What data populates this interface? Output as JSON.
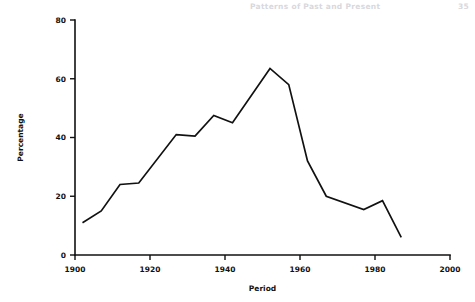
{
  "page_header": {
    "title": "Patterns of Past and Present",
    "page_number": "35"
  },
  "chart_data": {
    "type": "line",
    "title": "",
    "subtitle": "",
    "xlabel": "Period",
    "ylabel": "Percentage",
    "xlim": [
      1900,
      2000
    ],
    "ylim": [
      0,
      80
    ],
    "xticks": [
      1900,
      1920,
      1940,
      1960,
      1980,
      2000
    ],
    "xtick_labels": [
      "1900",
      "1920",
      "1940",
      "1960",
      "1980",
      "2000"
    ],
    "yticks": [
      0,
      20,
      40,
      60,
      80
    ],
    "ytick_labels": [
      "0",
      "20",
      "40",
      "60",
      "80"
    ],
    "grid": false,
    "legend": null,
    "legend_position": "none",
    "line_color": "#111111",
    "series": [
      {
        "name": "Percentage",
        "x": [
          1902,
          1907,
          1912,
          1917,
          1927,
          1932,
          1937,
          1942,
          1952,
          1957,
          1962,
          1967,
          1977,
          1982,
          1987
        ],
        "values": [
          11,
          15,
          24,
          24.5,
          41,
          40.5,
          47.5,
          45,
          63.5,
          58,
          32,
          20,
          15.5,
          18.5,
          6
        ]
      }
    ]
  }
}
